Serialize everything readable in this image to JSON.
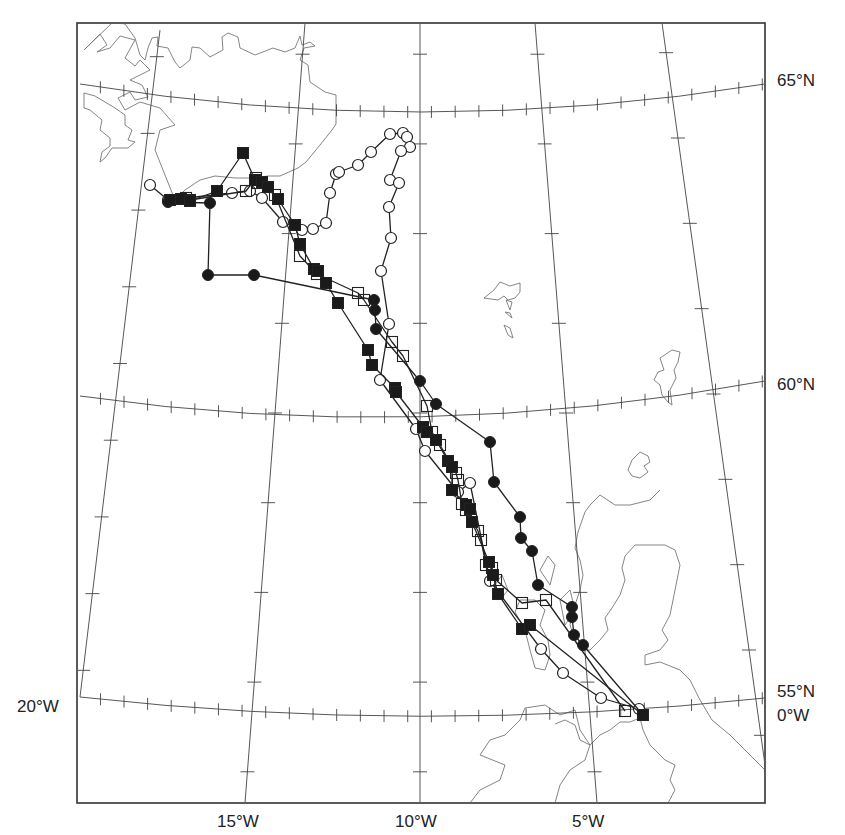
{
  "map": {
    "projection": "conic (lat/lon graticule)",
    "frame": {
      "left": 77,
      "top": 23,
      "right": 765,
      "bottom": 803
    },
    "colors": {
      "frame": "#333333",
      "graticule": "#444444",
      "coast": "#777777",
      "track": "#222222",
      "marker_fill": "#1a1a1a",
      "background": "#ffffff"
    },
    "labels": {
      "lat_65": "65°N",
      "lat_60": "60°N",
      "lat_55": "55°N",
      "lon_0": "0°W",
      "lon_20": "20°W",
      "lon_15": "15°W",
      "lon_10": "10°W",
      "lon_5": "5°W"
    },
    "legend": {
      "series": [
        {
          "name": "track-open-circle",
          "marker": "open circle"
        },
        {
          "name": "track-filled-circle",
          "marker": "filled circle"
        },
        {
          "name": "track-open-square",
          "marker": "open square"
        },
        {
          "name": "track-filled-square",
          "marker": "filled square"
        }
      ]
    },
    "tracks": {
      "open_circle": [
        [
          150,
          185
        ],
        [
          168,
          200
        ],
        [
          232,
          193
        ],
        [
          250,
          191
        ],
        [
          262,
          198
        ],
        [
          283,
          222
        ],
        [
          302,
          230
        ],
        [
          313,
          229
        ],
        [
          326,
          223
        ],
        [
          330,
          193
        ],
        [
          336,
          174
        ],
        [
          339,
          172
        ],
        [
          358,
          165
        ],
        [
          371,
          152
        ],
        [
          390,
          134
        ],
        [
          403,
          133
        ],
        [
          407,
          137
        ],
        [
          410,
          147
        ],
        [
          401,
          151
        ],
        [
          390,
          180
        ],
        [
          399,
          183
        ],
        [
          389,
          207
        ],
        [
          391,
          238
        ],
        [
          381,
          271
        ],
        [
          389,
          324
        ],
        [
          380,
          380
        ],
        [
          416,
          429
        ],
        [
          425,
          451
        ],
        [
          458,
          492
        ],
        [
          470,
          483
        ],
        [
          490,
          581
        ],
        [
          541,
          649
        ],
        [
          563,
          673
        ],
        [
          601,
          698
        ],
        [
          639,
          709
        ]
      ],
      "filled_circle": [
        [
          168,
          202
        ],
        [
          210,
          203
        ],
        [
          208,
          275
        ],
        [
          254,
          275
        ],
        [
          374,
          300
        ],
        [
          375,
          310
        ],
        [
          376,
          329
        ],
        [
          420,
          381
        ],
        [
          436,
          404
        ],
        [
          490,
          442
        ],
        [
          494,
          482
        ],
        [
          520,
          517
        ],
        [
          521,
          538
        ],
        [
          532,
          551
        ],
        [
          538,
          585
        ],
        [
          572,
          607
        ],
        [
          572,
          617
        ],
        [
          574,
          635
        ],
        [
          583,
          645
        ],
        [
          643,
          715
        ]
      ],
      "open_square": [
        [
          186,
          198
        ],
        [
          190,
          200
        ],
        [
          246,
          191
        ],
        [
          256,
          178
        ],
        [
          258,
          183
        ],
        [
          275,
          195
        ],
        [
          300,
          256
        ],
        [
          317,
          274
        ],
        [
          358,
          293
        ],
        [
          364,
          300
        ],
        [
          392,
          342
        ],
        [
          403,
          356
        ],
        [
          427,
          406
        ],
        [
          432,
          432
        ],
        [
          440,
          445
        ],
        [
          456,
          473
        ],
        [
          458,
          480
        ],
        [
          462,
          504
        ],
        [
          466,
          510
        ],
        [
          478,
          531
        ],
        [
          481,
          540
        ],
        [
          486,
          565
        ],
        [
          492,
          568
        ],
        [
          496,
          580
        ],
        [
          522,
          603
        ],
        [
          546,
          600
        ],
        [
          625,
          711
        ]
      ],
      "filled_square": [
        [
          170,
          200
        ],
        [
          181,
          199
        ],
        [
          190,
          201
        ],
        [
          217,
          191
        ],
        [
          243,
          153
        ],
        [
          255,
          180
        ],
        [
          262,
          182
        ],
        [
          268,
          187
        ],
        [
          278,
          199
        ],
        [
          295,
          225
        ],
        [
          300,
          244
        ],
        [
          314,
          269
        ],
        [
          318,
          271
        ],
        [
          326,
          283
        ],
        [
          338,
          303
        ],
        [
          368,
          350
        ],
        [
          372,
          365
        ],
        [
          395,
          388
        ],
        [
          396,
          392
        ],
        [
          423,
          427
        ],
        [
          427,
          432
        ],
        [
          436,
          440
        ],
        [
          448,
          461
        ],
        [
          452,
          467
        ],
        [
          452,
          490
        ],
        [
          466,
          505
        ],
        [
          470,
          509
        ],
        [
          472,
          522
        ],
        [
          489,
          562
        ],
        [
          493,
          575
        ],
        [
          498,
          594
        ],
        [
          522,
          629
        ],
        [
          530,
          625
        ],
        [
          643,
          715
        ]
      ]
    },
    "coastlines": {
      "iceland": "M 84 50 L 100 34 L 107 45 L 97 52 L 110 48 L 120 36 L 135 40 L 125 58 L 135 66 L 140 60 L 150 70 L 130 80 L 142 85 L 148 97 L 135 100 L 130 92 L 118 98 L 125 110 L 140 102 L 160 108 L 175 125 L 160 130 L 155 150 L 165 175 L 175 200 L 185 190 L 200 180 L 215 176 L 235 178 L 252 178 L 268 176 L 280 176 L 298 168 L 306 162 L 320 145 L 332 130 L 336 124 L 336 95 L 325 92 L 310 82 L 308 65 L 300 60 L 304 48 L 315 46 L 310 42 L 302 45 L 300 36 L 295 48 L 285 52 L 273 48 L 255 55 L 240 48 L 238 37 L 228 33 L 222 37 L 223 50 L 210 57 L 200 48 L 192 47 L 190 60 L 180 68 L 175 62 L 168 48 L 157 46 L 158 37 L 152 38 L 148 48 L 145 60 L 140 55 L 135 38 L 125 24 L 113 22 Z",
      "iceland_west": "M 84 93 L 95 96 L 115 108 L 125 115 L 125 125 L 132 130 L 128 140 L 135 142 L 128 148 L 112 148 L 105 158 L 100 162 L 102 152 L 110 146 L 110 138 L 100 130 L 102 120 L 90 110 L 84 108 Z",
      "faroes_a": "M 484 298 L 494 290 L 500 282 L 510 286 L 520 283 L 520 292 L 515 298 L 508 300 L 504 296 L 498 300 Z",
      "faroes_b": "M 506 300 L 510 310 L 512 302 Z",
      "faroes_c": "M 505 312 L 512 318 L 510 313 Z",
      "faroes_d": "M 504 325 L 508 335 L 513 338 L 510 328 Z",
      "shetland": "M 660 358 L 672 350 L 680 352 L 678 362 L 674 370 L 676 378 L 670 390 L 672 405 L 668 402 L 662 395 L 660 385 L 654 380 L 658 372 L 664 370 Z",
      "orkney": "M 632 460 L 640 452 L 648 456 L 650 462 L 644 466 L 648 472 L 640 478 L 632 476 L 628 470 Z",
      "scotland": "M 660 490 L 650 500 L 630 505 L 615 505 L 600 495 L 595 500 L 590 505 L 585 512 L 578 532 L 575 548 L 580 560 L 583 575 L 580 590 L 575 605 L 570 625 L 575 640 L 580 650 L 590 650 L 600 640 L 608 630 L 605 618 L 612 608 L 620 595 L 625 580 L 622 568 L 625 556 L 635 545 L 650 545 L 665 545 L 675 550 L 680 565 L 675 590 L 670 615 L 662 630 L 668 640 L 660 650 L 645 655 L 645 665 L 660 662 L 680 670 L 690 680 L 700 700 L 712 720 L 730 735 L 755 760 L 765 770",
      "hebrides": "M 520 600 L 515 612 L 525 630 L 530 650 L 535 668 L 545 670 L 550 655 L 548 640 L 540 625 L 545 610 L 535 600 Z M 495 585 L 502 575 L 508 590 L 500 600 Z M 540 570 L 548 556 L 555 565 L 550 585 Z M 560 600 L 570 590 L 575 610 L 565 625 Z",
      "ireland": "M 470 803 L 480 790 L 500 780 L 505 765 L 480 755 L 490 740 L 505 735 L 520 720 L 525 708 L 545 705 L 560 715 L 575 710 L 580 730 L 590 745 L 585 760 L 570 770 L 560 785 L 555 803",
      "ireland_north": "M 555 724 L 565 720 L 575 725 L 580 740 L 590 745 L 600 735 L 610 730 L 620 722 L 630 722 L 640 718",
      "england": "M 640 718 L 643 730 L 650 745 L 665 760 L 675 765 L 670 780 L 675 790 L 668 803"
    },
    "graticule": {
      "meridians": [
        "M 80 697 L 160 30",
        "M 245 803 L 305 23",
        "M 420 803 L 420 23",
        "M 597 803 L 535 23",
        "M 765 765 L 662 23"
      ],
      "parallels": [
        "M 80 84 Q 420 140 765 84",
        "M 80 396 Q 420 445 765 381",
        "M 80 697 Q 420 735 765 698"
      ]
    }
  }
}
